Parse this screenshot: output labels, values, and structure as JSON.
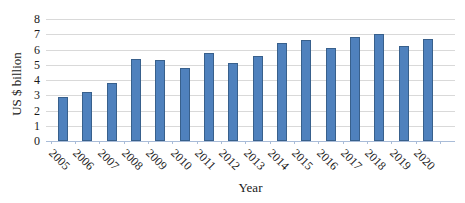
{
  "chart_data": {
    "type": "bar",
    "title": "",
    "xlabel": "Year",
    "ylabel": "US $ billion",
    "categories": [
      "2005",
      "2006",
      "2007",
      "2008",
      "2009",
      "2010",
      "2011",
      "2012",
      "2013",
      "2014",
      "2015",
      "2016",
      "2017",
      "2018",
      "2019",
      "2020"
    ],
    "values": [
      2.9,
      3.2,
      3.8,
      5.4,
      5.3,
      4.8,
      5.8,
      5.1,
      5.6,
      6.4,
      6.6,
      6.1,
      6.8,
      7.0,
      6.2,
      6.7
    ],
    "ylim": [
      0,
      8
    ],
    "yticks": [
      0,
      1,
      2,
      3,
      4,
      5,
      6,
      7,
      8
    ],
    "grid": true,
    "legend": "none",
    "colors": {
      "bar_fill": "#4f81bd",
      "bar_border": "#38608c",
      "gridline": "#d9d9d9",
      "axis_line": "#a9bcd8",
      "text": "#1a1a1a",
      "background": "#ffffff"
    }
  }
}
